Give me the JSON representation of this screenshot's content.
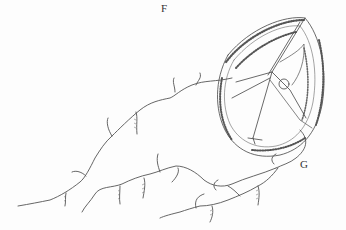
{
  "figure": {
    "labels": {
      "top": "F",
      "right": "G"
    },
    "colors": {
      "background": "#fdfdfd",
      "ink": "#444444"
    }
  }
}
